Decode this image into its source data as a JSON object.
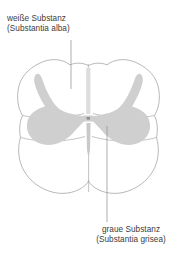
{
  "figure": {
    "type": "anatomical-cross-section",
    "colors": {
      "gray_matter_fill": "#cfcfcf",
      "white_matter_fill": "#ffffff",
      "outline_stroke": "#9a9a9a",
      "leader_line": "#8c8c8c",
      "label_text": "#3b3b3b",
      "background": "#ffffff"
    }
  },
  "labels": {
    "white_matter": {
      "line1": "weiße Substanz",
      "line2": "(Substantia alba)"
    },
    "gray_matter": {
      "line1": "graue Substanz",
      "line2": "(Substantia grisea)"
    }
  },
  "leaders": {
    "white_matter": {
      "from_x": 71,
      "from_y": 40,
      "to_x": 71,
      "to_y": 89
    },
    "gray_matter": {
      "from_x": 107,
      "from_y": 126,
      "to_x": 107,
      "to_y": 222
    }
  }
}
